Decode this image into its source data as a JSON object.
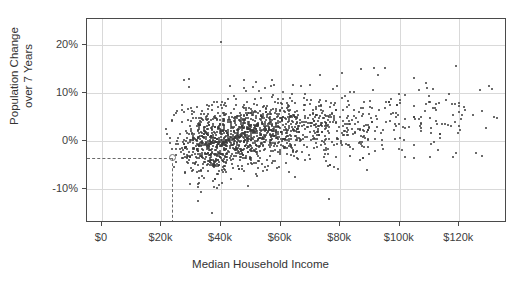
{
  "chart_data": {
    "type": "scatter",
    "title": "",
    "xlabel": "Median Household Income",
    "ylabel_line1": "Population Change",
    "ylabel_line2": "over 7 Years",
    "xlim": [
      -5000,
      136000
    ],
    "ylim": [
      -0.17,
      0.255
    ],
    "grid": true,
    "legend": "none",
    "xticks": [
      0,
      20000,
      40000,
      60000,
      80000,
      100000,
      120000
    ],
    "xtick_labels": [
      "$0",
      "$20k",
      "$40k",
      "$60k",
      "$80k",
      "$100k",
      "$120k"
    ],
    "yticks": [
      0.2,
      0.1,
      0.0,
      -0.1
    ],
    "ytick_labels": [
      "20%",
      "10%",
      "0%",
      "-10%"
    ],
    "point_color": "#3a3a3a",
    "gridline_color": "#d9d9d9",
    "frame_color": "#4a4a4a",
    "n_points": 1640,
    "highlight": {
      "x": 23700,
      "y": -0.034,
      "x_label": "$23.7k",
      "y_label": "-3.4%",
      "marker": "open-circle",
      "guide_style": "dashed",
      "guide_color": "#6b6b6b"
    },
    "cluster_summary": [
      {
        "x_center": 35000,
        "y_center": -0.01,
        "weight": 0.22
      },
      {
        "x_center": 45000,
        "y_center": 0.01,
        "weight": 0.3
      },
      {
        "x_center": 55000,
        "y_center": 0.025,
        "weight": 0.24
      },
      {
        "x_center": 68000,
        "y_center": 0.03,
        "weight": 0.13
      },
      {
        "x_center": 85000,
        "y_center": 0.04,
        "weight": 0.07
      },
      {
        "x_center": 105000,
        "y_center": 0.05,
        "weight": 0.04
      }
    ]
  }
}
